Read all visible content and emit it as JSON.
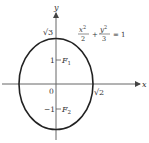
{
  "diagram": {
    "type": "ellipse-graph",
    "equation": {
      "x_num": "x",
      "x_exp": "2",
      "x_den": "2",
      "plus": "+",
      "y_num": "y",
      "y_exp": "2",
      "y_den": "3",
      "equals": "= 1"
    },
    "axes": {
      "x_label": "x",
      "y_label": "y"
    },
    "labels": {
      "origin": "0",
      "y_intercept_top": "√3",
      "x_intercept_right": "√2",
      "tick_pos_one": "1",
      "tick_neg_one": "−1",
      "focus_one": "F",
      "focus_one_sub": "1",
      "focus_two": "F",
      "focus_two_sub": "2"
    },
    "colors": {
      "curve": "#222222",
      "axis": "#555555",
      "text": "#333333"
    }
  }
}
